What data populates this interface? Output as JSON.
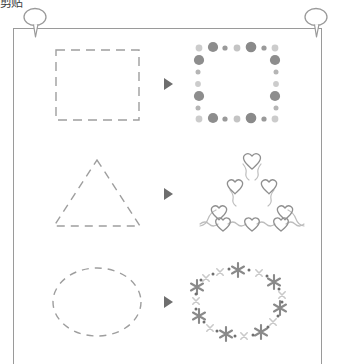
{
  "page": {
    "clipped_label": "剪贴",
    "background_color": "#ffffff",
    "frame_color": "#9a9a9a",
    "dash_color": "#9e9e9e",
    "arrow_color": "#6e6e6e",
    "decor_dark": "#8a8a8a",
    "decor_light": "#c9c9c9"
  },
  "pins": [
    {
      "name": "top-left-pin",
      "side": "left"
    },
    {
      "name": "top-right-pin",
      "side": "right"
    }
  ],
  "rows": [
    {
      "index": 1,
      "source_shape": "dashed-square",
      "source_label": "Square",
      "arrow": "▶",
      "result_shape": "dotted-square",
      "result_label": "Dot brush square",
      "decoration": "dots"
    },
    {
      "index": 2,
      "source_shape": "dashed-triangle",
      "source_label": "Triangle",
      "arrow": "▶",
      "result_shape": "heart-triangle",
      "result_label": "Heart brush triangle",
      "decoration": "hearts"
    },
    {
      "index": 3,
      "source_shape": "dashed-ellipse",
      "source_label": "Ellipse",
      "arrow": "▶",
      "result_shape": "star-ellipse",
      "result_label": "Star brush ellipse",
      "decoration": "stars"
    }
  ]
}
